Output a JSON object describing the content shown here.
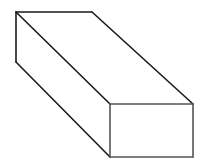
{
  "diagram": {
    "type": "3d-rectangular-prism",
    "background": "#ffffff",
    "stroke": "#1a1a1a",
    "stroke_width": 1.6,
    "front_face_stroke": "#555555",
    "vertices": {
      "back_top_left": [
        16,
        12
      ],
      "back_top_right": [
        92,
        12
      ],
      "back_bottom_left": [
        16,
        62
      ],
      "front_top_left": [
        110,
        104
      ],
      "front_top_right": [
        193,
        104
      ],
      "front_bottom_left": [
        110,
        157
      ],
      "front_bottom_right": [
        193,
        157
      ]
    }
  }
}
